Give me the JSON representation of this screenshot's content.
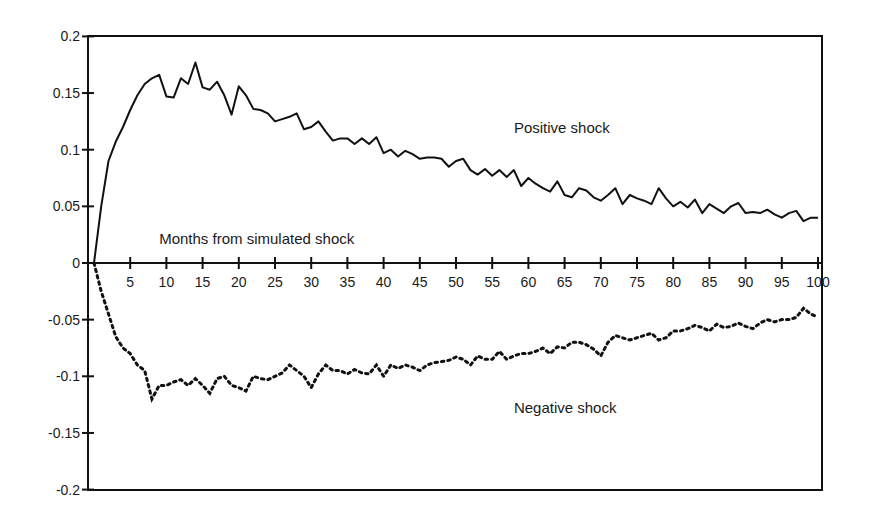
{
  "chart_data": {
    "type": "line",
    "title": "",
    "xlabel": "Months from simulated shock",
    "ylabel": "",
    "xlim": [
      0,
      100
    ],
    "ylim": [
      -0.2,
      0.2
    ],
    "grid": false,
    "legend": "none (inline annotations)",
    "x_ticks": [
      5,
      10,
      15,
      20,
      25,
      30,
      35,
      40,
      45,
      50,
      55,
      60,
      65,
      70,
      75,
      80,
      85,
      90,
      95,
      100
    ],
    "x_tick_labels": [
      "5",
      "10",
      "15",
      "20",
      "25",
      "30",
      "35",
      "40",
      "45",
      "50",
      "55",
      "60",
      "65",
      "70",
      "75",
      "80",
      "85",
      "90",
      "95",
      "100"
    ],
    "y_ticks": [
      0.2,
      0.15,
      0.1,
      0.05,
      0,
      -0.05,
      -0.1,
      -0.15,
      -0.2
    ],
    "y_tick_labels": [
      "0.2",
      "0.15",
      "0.1",
      "0.05",
      "0",
      "-0.05",
      "-0.1",
      "-0.15",
      "-0.2"
    ],
    "annotations": [
      {
        "text": "Positive shock",
        "x": 58,
        "y": 0.115
      },
      {
        "text": "Months from simulated shock",
        "x": 9,
        "y": 0.017
      },
      {
        "text": "Negative shock",
        "x": 58,
        "y": -0.132
      }
    ],
    "x": [
      0,
      1,
      2,
      3,
      4,
      5,
      6,
      7,
      8,
      9,
      10,
      11,
      12,
      13,
      14,
      15,
      16,
      17,
      18,
      19,
      20,
      21,
      22,
      23,
      24,
      25,
      26,
      27,
      28,
      29,
      30,
      31,
      32,
      33,
      34,
      35,
      36,
      37,
      38,
      39,
      40,
      41,
      42,
      43,
      44,
      45,
      46,
      47,
      48,
      49,
      50,
      51,
      52,
      53,
      54,
      55,
      56,
      57,
      58,
      59,
      60,
      61,
      62,
      63,
      64,
      65,
      66,
      67,
      68,
      69,
      70,
      71,
      72,
      73,
      74,
      75,
      76,
      77,
      78,
      79,
      80,
      81,
      82,
      83,
      84,
      85,
      86,
      87,
      88,
      89,
      90,
      91,
      92,
      93,
      94,
      95,
      96,
      97,
      98,
      99,
      100
    ],
    "series": [
      {
        "name": "Positive shock",
        "style": "solid",
        "values": [
          0,
          0.05,
          0.09,
          0.107,
          0.12,
          0.135,
          0.148,
          0.158,
          0.163,
          0.166,
          0.147,
          0.146,
          0.163,
          0.158,
          0.177,
          0.155,
          0.153,
          0.16,
          0.148,
          0.131,
          0.156,
          0.148,
          0.136,
          0.135,
          0.132,
          0.125,
          0.127,
          0.129,
          0.132,
          0.118,
          0.12,
          0.125,
          0.116,
          0.108,
          0.11,
          0.11,
          0.105,
          0.11,
          0.105,
          0.111,
          0.097,
          0.1,
          0.094,
          0.099,
          0.096,
          0.092,
          0.093,
          0.093,
          0.092,
          0.085,
          0.09,
          0.092,
          0.082,
          0.078,
          0.083,
          0.077,
          0.082,
          0.076,
          0.082,
          0.068,
          0.075,
          0.07,
          0.066,
          0.063,
          0.072,
          0.06,
          0.058,
          0.066,
          0.064,
          0.058,
          0.055,
          0.06,
          0.066,
          0.052,
          0.06,
          0.057,
          0.055,
          0.052,
          0.066,
          0.057,
          0.05,
          0.054,
          0.049,
          0.056,
          0.044,
          0.052,
          0.048,
          0.044,
          0.05,
          0.053,
          0.044,
          0.045,
          0.044,
          0.047,
          0.043,
          0.04,
          0.044,
          0.046,
          0.037,
          0.04,
          0.04
        ]
      },
      {
        "name": "Negative shock",
        "style": "dotted",
        "values": [
          0,
          -0.025,
          -0.045,
          -0.065,
          -0.075,
          -0.08,
          -0.09,
          -0.095,
          -0.12,
          -0.108,
          -0.108,
          -0.105,
          -0.103,
          -0.108,
          -0.102,
          -0.108,
          -0.115,
          -0.102,
          -0.1,
          -0.108,
          -0.11,
          -0.113,
          -0.1,
          -0.102,
          -0.103,
          -0.1,
          -0.097,
          -0.09,
          -0.095,
          -0.1,
          -0.11,
          -0.098,
          -0.09,
          -0.095,
          -0.095,
          -0.098,
          -0.094,
          -0.097,
          -0.098,
          -0.09,
          -0.1,
          -0.09,
          -0.093,
          -0.09,
          -0.092,
          -0.095,
          -0.09,
          -0.088,
          -0.087,
          -0.086,
          -0.083,
          -0.085,
          -0.09,
          -0.082,
          -0.085,
          -0.085,
          -0.078,
          -0.085,
          -0.082,
          -0.08,
          -0.08,
          -0.078,
          -0.075,
          -0.08,
          -0.074,
          -0.075,
          -0.07,
          -0.07,
          -0.072,
          -0.076,
          -0.082,
          -0.07,
          -0.064,
          -0.066,
          -0.068,
          -0.066,
          -0.064,
          -0.062,
          -0.068,
          -0.066,
          -0.06,
          -0.06,
          -0.058,
          -0.055,
          -0.057,
          -0.06,
          -0.054,
          -0.057,
          -0.056,
          -0.053,
          -0.056,
          -0.058,
          -0.053,
          -0.05,
          -0.052,
          -0.05,
          -0.05,
          -0.048,
          -0.04,
          -0.045,
          -0.048
        ]
      }
    ]
  },
  "colors": {
    "line": "#111111",
    "axis": "#111111",
    "background": "#ffffff"
  },
  "layout": {
    "plot_left": 88,
    "plot_right": 822,
    "plot_top": 36,
    "plot_bottom": 490,
    "x0_px": 94,
    "px_per_month": 7.24,
    "y_zero_px": 263,
    "px_per_unit_y": 1133
  }
}
